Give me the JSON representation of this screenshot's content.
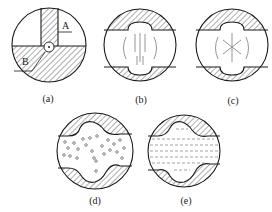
{
  "figure": {
    "panels": [
      {
        "id": "a",
        "label": "(a)",
        "annotations": [
          "A",
          "B"
        ],
        "description": "Circle with hatched rectangular slot (A) on top and hatched lower half (B), small circle at junction"
      },
      {
        "id": "b",
        "label": "(b)",
        "description": "Circular section with hatched top and bottom caps having a rounded bulge; vertical lines and arcs in the center"
      },
      {
        "id": "c",
        "label": "(c)",
        "description": "Circular section with hatched top and bottom caps having a rounded bulge; radial star lines and arcs in the center"
      },
      {
        "id": "d",
        "label": "(d)",
        "description": "Circular section with wavy hatched top and bottom regions; small circles scattered in the middle"
      },
      {
        "id": "e",
        "label": "(e)",
        "description": "Circular section with wavy hatched top and bottom regions; horizontal dashed lines in the middle"
      }
    ]
  }
}
